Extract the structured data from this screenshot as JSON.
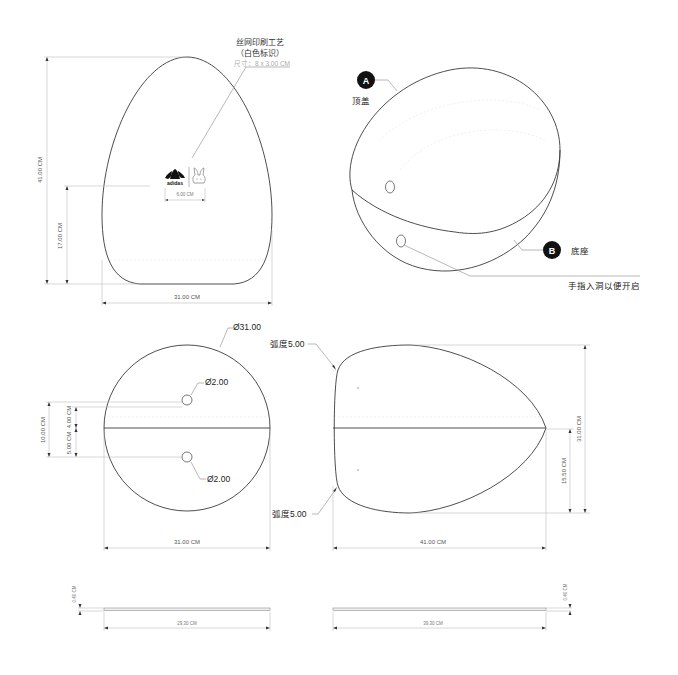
{
  "front_view": {
    "height_label": "41.00 CM",
    "logo_height_label": "17.00 CM",
    "width_label": "31.00 CM",
    "logo_width_label": "6.00 CM",
    "print_note": {
      "line1": "丝网印刷工艺",
      "line2": "（白色标识）",
      "line3": "尺寸：8 x 3.00 CM"
    },
    "logo_text": "adidas"
  },
  "perspective_view": {
    "part_a": {
      "badge": "A",
      "label": "顶盖"
    },
    "part_b": {
      "badge": "B",
      "label": "底座"
    },
    "finger_hole_note": "手指入洞以便开启"
  },
  "top_view": {
    "diameter_label": "Ø31.00",
    "hole_top_label": "Ø2.00",
    "hole_bottom_label": "Ø2.00",
    "dim_total": "10.00 CM",
    "dim_upper": "4.00 CM",
    "dim_lower": "5.00 CM",
    "width_label": "31.00 CM"
  },
  "side_view": {
    "radius_top_label": "弧度5.00",
    "radius_bottom_label": "弧度5.00",
    "height_label": "31.00 CM",
    "half_height_label": "15.50 CM",
    "width_label": "41.00 CM"
  },
  "plate_left": {
    "thickness_label": "0.40 CM",
    "length_label": "29.30 CM"
  },
  "plate_right": {
    "thickness_label": "0.40 CM",
    "length_label": "39.30 CM"
  }
}
